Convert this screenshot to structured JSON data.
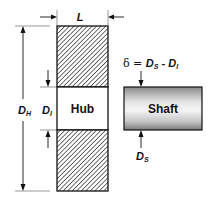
{
  "diagram": {
    "hub": {
      "label": "Hub",
      "length_label": "L",
      "outer_diameter_label": "D",
      "outer_diameter_sub": "H",
      "inner_diameter_label": "D",
      "inner_diameter_sub": "I"
    },
    "shaft": {
      "label": "Shaft",
      "diameter_label": "D",
      "diameter_sub": "S"
    },
    "interference": {
      "symbol": "δ",
      "equals": " = ",
      "term1": "D",
      "term1_sub": "S",
      "minus": " - ",
      "term2": "D",
      "term2_sub": "I"
    },
    "colors": {
      "line": "#111111",
      "hatch": "#222222",
      "shaft_light": "#f2f2f2",
      "shaft_dark": "#8a8a8a"
    }
  }
}
